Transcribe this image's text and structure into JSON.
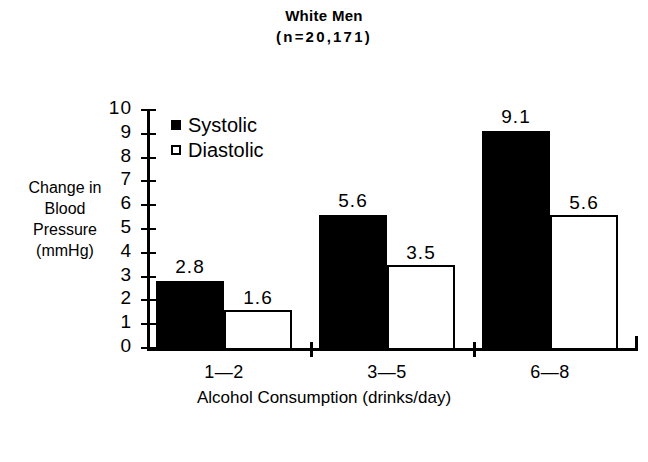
{
  "chart_data": {
    "type": "bar",
    "title": "White Men",
    "subtitle": "(n=20,171)",
    "xlabel": "Alcohol Consumption (drinks/day)",
    "ylabel_lines": [
      "Change in",
      "Blood",
      "Pressure",
      "(mmHg)"
    ],
    "ylabel": "Change in Blood Pressure (mmHg)",
    "categories": [
      "1—2",
      "3—5",
      "6—8"
    ],
    "series": [
      {
        "name": "Systolic",
        "values": [
          2.8,
          5.6,
          9.1
        ],
        "swatch": "filled",
        "color": "#000000"
      },
      {
        "name": "Diastolic",
        "values": [
          1.6,
          3.5,
          5.6
        ],
        "swatch": "hollow",
        "color": "#ffffff"
      }
    ],
    "value_labels": [
      [
        "2.8",
        "5.6",
        "9.1"
      ],
      [
        "1.6",
        "3.5",
        "5.6"
      ]
    ],
    "ylim": [
      0,
      10
    ],
    "yticks": [
      0,
      1,
      2,
      3,
      4,
      5,
      6,
      7,
      8,
      9,
      10
    ],
    "ytick_labels": [
      "0",
      "1",
      "2",
      "3",
      "4",
      "5",
      "6",
      "7",
      "8",
      "9",
      "10"
    ],
    "grid": false,
    "legend_position": "top-left-inside"
  }
}
